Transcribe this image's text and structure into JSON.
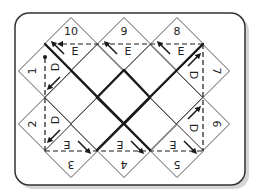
{
  "diagram": {
    "card": {
      "x": 15,
      "y": 13,
      "w": 230,
      "h": 172,
      "r": 14,
      "stroke": "#333333",
      "shadow": "#bbbbbb",
      "fill": "#ffffff"
    },
    "half": 26.5,
    "line_color": "#1a1a1a",
    "cells": [
      {
        "id": "10",
        "cx": 71,
        "cy": 44,
        "number": "10",
        "num_rot": 0,
        "num_dx": 0,
        "num_dy": -13,
        "letter": "E",
        "let_rot": 0,
        "let_dx": 4,
        "let_dy": 7,
        "arrow": [
          [
            64,
            54
          ],
          [
            53,
            43
          ]
        ]
      },
      {
        "id": "9",
        "cx": 124,
        "cy": 44,
        "number": "9",
        "num_rot": 0,
        "num_dx": 0,
        "num_dy": -13,
        "letter": "E",
        "let_rot": 0,
        "let_dx": 4,
        "let_dy": 7,
        "arrow": [
          [
            117,
            54
          ],
          [
            106,
            43
          ]
        ]
      },
      {
        "id": "8",
        "cx": 177,
        "cy": 44,
        "number": "8",
        "num_rot": 0,
        "num_dx": 0,
        "num_dy": -13,
        "letter": "E",
        "let_rot": 0,
        "let_dx": 4,
        "let_dy": 7,
        "arrow": [
          [
            170,
            54
          ],
          [
            159,
            43
          ]
        ]
      },
      {
        "id": "1",
        "cx": 45,
        "cy": 71,
        "number": "1",
        "num_rot": -90,
        "num_dx": -13,
        "num_dy": 0,
        "letter": "D",
        "let_rot": -90,
        "let_dx": 10,
        "let_dy": -4,
        "arrow": [
          [
            60,
            77
          ],
          [
            49,
            88
          ]
        ]
      },
      {
        "id": "7",
        "cx": 203,
        "cy": 71,
        "number": "7",
        "num_rot": 90,
        "num_dx": 13,
        "num_dy": 0,
        "letter": "D",
        "let_rot": 90,
        "let_dx": -10,
        "let_dy": 4,
        "arrow": [
          [
            188,
            66
          ],
          [
            199,
            55
          ]
        ]
      },
      {
        "id": "2",
        "cx": 45,
        "cy": 124,
        "number": "2",
        "num_rot": -90,
        "num_dx": -13,
        "num_dy": 0,
        "letter": "D",
        "let_rot": -90,
        "let_dx": 10,
        "let_dy": -4,
        "arrow": [
          [
            60,
            130
          ],
          [
            49,
            141
          ]
        ]
      },
      {
        "id": "6",
        "cx": 203,
        "cy": 124,
        "number": "6",
        "num_rot": 90,
        "num_dx": 13,
        "num_dy": 0,
        "letter": "D",
        "let_rot": 90,
        "let_dx": -10,
        "let_dy": 4,
        "arrow": [
          [
            188,
            119
          ],
          [
            199,
            108
          ]
        ]
      },
      {
        "id": "3",
        "cx": 71,
        "cy": 151,
        "number": "3",
        "num_rot": 180,
        "num_dx": 0,
        "num_dy": 13,
        "letter": "E",
        "let_rot": 180,
        "let_dx": -4,
        "let_dy": -7,
        "arrow": [
          [
            78,
            141
          ],
          [
            89,
            152
          ]
        ]
      },
      {
        "id": "4",
        "cx": 124,
        "cy": 151,
        "number": "4",
        "num_rot": 180,
        "num_dx": 0,
        "num_dy": 13,
        "letter": "E",
        "let_rot": 180,
        "let_dx": -4,
        "let_dy": -7,
        "arrow": [
          [
            131,
            141
          ],
          [
            142,
            152
          ]
        ]
      },
      {
        "id": "5",
        "cx": 177,
        "cy": 151,
        "number": "5",
        "num_rot": 180,
        "num_dx": 0,
        "num_dy": 13,
        "letter": "E",
        "let_rot": 180,
        "let_dx": -4,
        "let_dy": -7,
        "arrow": [
          [
            184,
            141
          ],
          [
            195,
            152
          ]
        ]
      }
    ],
    "inner_cells": [
      [
        97,
        71
      ],
      [
        150,
        71
      ],
      [
        71,
        97.5
      ],
      [
        176,
        97.5
      ],
      [
        97,
        124
      ],
      [
        150,
        124
      ]
    ],
    "thick_lines": [
      [
        [
          45,
          44
        ],
        [
          150,
          150
        ]
      ],
      [
        [
          203,
          44
        ],
        [
          97,
          150
        ]
      ],
      [
        [
          124,
          70
        ],
        [
          97,
          97.5
        ]
      ],
      [
        [
          124,
          70
        ],
        [
          150,
          97.5
        ]
      ],
      [
        [
          97,
          97.5
        ],
        [
          124,
          124
        ]
      ],
      [
        [
          150,
          97.5
        ],
        [
          124,
          124
        ]
      ]
    ],
    "dashed_path": {
      "top": [
        [
          203,
          44
        ],
        [
          60,
          44
        ]
      ],
      "right": [
        [
          203,
          44
        ],
        [
          203,
          151
        ]
      ],
      "bottom": [
        [
          45,
          151
        ],
        [
          203,
          151
        ]
      ],
      "left": [
        [
          45,
          151
        ],
        [
          45,
          58
        ]
      ]
    },
    "dashed_arrowhead_left": [
      60,
      44
    ],
    "dashed_dot": [
      45,
      57
    ],
    "cell_border_color": "#444444"
  }
}
